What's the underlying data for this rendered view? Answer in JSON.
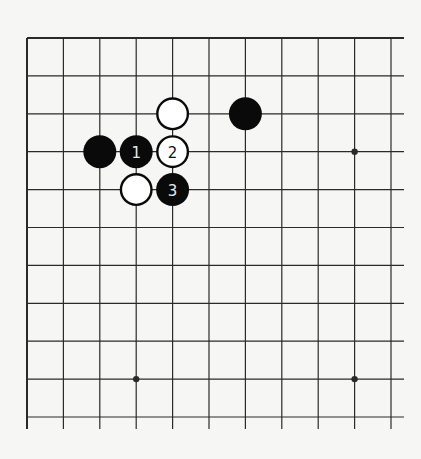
{
  "diagram": {
    "type": "go-board-partial",
    "grid": {
      "columns": 11,
      "rows": 11,
      "x_start": 27,
      "y_start": 38,
      "x_spacing": 36.4,
      "y_spacing": 37.9,
      "top_edge_is_border": true,
      "left_edge_is_border": true,
      "right_extends": true,
      "bottom_extends": true,
      "line_color": "#2a2a2a",
      "background_color": "#f6f6f4"
    },
    "star_points": [
      {
        "col": 9,
        "row": 3
      },
      {
        "col": 3,
        "row": 9
      },
      {
        "col": 9,
        "row": 9
      }
    ],
    "stones": [
      {
        "color": "white",
        "col": 4,
        "row": 2,
        "label": ""
      },
      {
        "color": "black",
        "col": 6,
        "row": 2,
        "label": ""
      },
      {
        "color": "black",
        "col": 2,
        "row": 3,
        "label": ""
      },
      {
        "color": "black",
        "col": 3,
        "row": 3,
        "label": "1"
      },
      {
        "color": "white",
        "col": 4,
        "row": 3,
        "label": "2"
      },
      {
        "color": "white",
        "col": 3,
        "row": 4,
        "label": ""
      },
      {
        "color": "black",
        "col": 4,
        "row": 4,
        "label": "3"
      }
    ],
    "colors": {
      "black_stone": "#0a0a0a",
      "white_stone": "#ffffff",
      "stone_outline": "#0a0a0a",
      "black_label": "#e8e8e8",
      "white_label": "#111111"
    }
  }
}
